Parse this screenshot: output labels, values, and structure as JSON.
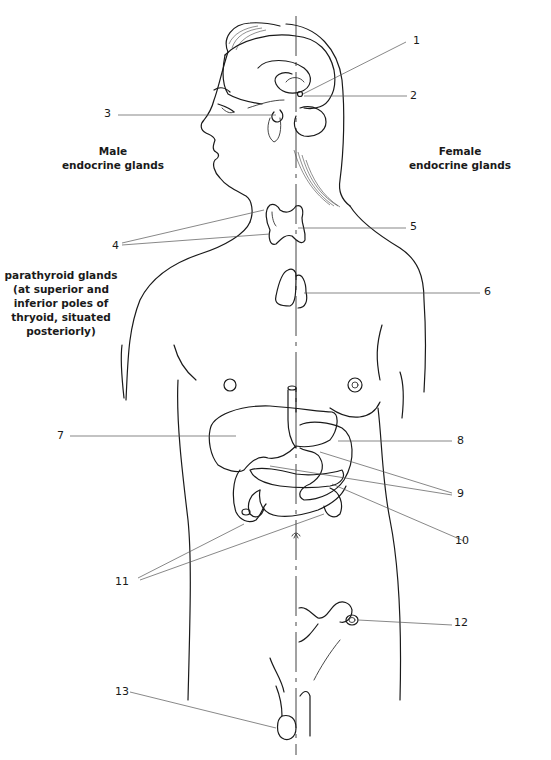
{
  "figure": {
    "title": "Endocrine glands",
    "captions": {
      "male": [
        "Male",
        "endocrine glands"
      ],
      "female": [
        "Female",
        "endocrine glands"
      ],
      "parathyroid": [
        "parathyroid glands",
        "(at superior and",
        "inferior poles of",
        "thryoid, situated",
        "posteriorly)"
      ]
    },
    "labels": [
      {
        "id": "1",
        "text": "1"
      },
      {
        "id": "2",
        "text": "2"
      },
      {
        "id": "3",
        "text": "3"
      },
      {
        "id": "4",
        "text": "4"
      },
      {
        "id": "5",
        "text": "5"
      },
      {
        "id": "6",
        "text": "6"
      },
      {
        "id": "7",
        "text": "7"
      },
      {
        "id": "8",
        "text": "8"
      },
      {
        "id": "9",
        "text": "9"
      },
      {
        "id": "10",
        "text": "10"
      },
      {
        "id": "11",
        "text": "11"
      },
      {
        "id": "12",
        "text": "12"
      },
      {
        "id": "13",
        "text": "13"
      }
    ],
    "colors": {
      "line": "#1a1a1a",
      "leader": "#555555",
      "background": "#ffffff"
    }
  }
}
